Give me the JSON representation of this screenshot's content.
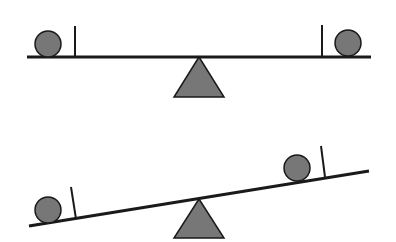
{
  "diagram": {
    "colors": {
      "background": "#ffffff",
      "stroke": "#1a1a1a",
      "fill": "#777777"
    },
    "seesaws": [
      {
        "state": "balanced",
        "beam": {
          "x1": 27,
          "y1": 57,
          "x2": 371,
          "y2": 57
        },
        "fulcrum": {
          "apex": [
            199,
            57
          ],
          "left": [
            174,
            97
          ],
          "right": [
            224,
            97
          ]
        },
        "balls": [
          {
            "side": "left",
            "cx": 48,
            "cy": 44,
            "r": 13
          },
          {
            "side": "right",
            "cx": 348,
            "cy": 43,
            "r": 13
          }
        ],
        "posts": [
          {
            "side": "left",
            "x1": 75,
            "y1": 57,
            "x2": 75,
            "y2": 26
          },
          {
            "side": "right",
            "x1": 322,
            "y1": 57,
            "x2": 322,
            "y2": 25
          }
        ]
      },
      {
        "state": "tilted",
        "beam": {
          "x1": 29,
          "y1": 226,
          "x2": 369,
          "y2": 171
        },
        "fulcrum": {
          "apex": [
            199,
            199
          ],
          "left": [
            174,
            238
          ],
          "right": [
            224,
            238
          ]
        },
        "balls": [
          {
            "side": "left",
            "cx": 48,
            "cy": 210,
            "r": 13
          },
          {
            "side": "right",
            "cx": 297,
            "cy": 168,
            "r": 13
          }
        ],
        "posts": [
          {
            "side": "left",
            "x1": 76,
            "y1": 219,
            "x2": 71,
            "y2": 187
          },
          {
            "side": "right",
            "x1": 325,
            "y1": 177,
            "x2": 321,
            "y2": 146
          }
        ]
      }
    ]
  }
}
